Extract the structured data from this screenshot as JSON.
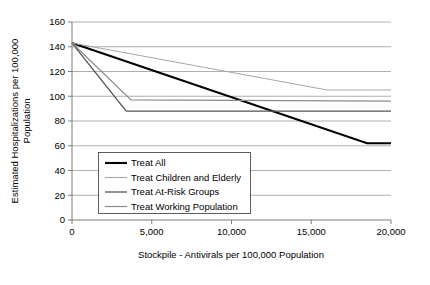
{
  "chart_data": {
    "type": "line",
    "title": "",
    "xlabel": "Stockpile - Antivirals per 100,000 Population",
    "ylabel": "Estimated Hospitalizations per 100,000 Population",
    "xlim": [
      0,
      20000
    ],
    "ylim": [
      0,
      160
    ],
    "xticks": [
      0,
      5000,
      10000,
      15000,
      20000
    ],
    "xtick_labels": [
      "0",
      "5,000",
      "10,000",
      "15,000",
      "20,000"
    ],
    "yticks": [
      0,
      20,
      40,
      60,
      80,
      100,
      120,
      140,
      160
    ],
    "ytick_labels": [
      "0",
      "20",
      "40",
      "60",
      "80",
      "100",
      "120",
      "140",
      "160"
    ],
    "grid": "horizontal",
    "legend_position": "lower-left-inside",
    "series": [
      {
        "name": "Treat All",
        "color": "#000000",
        "width": 2.1,
        "points": [
          [
            0,
            143
          ],
          [
            18500,
            62
          ],
          [
            20000,
            62
          ]
        ]
      },
      {
        "name": "Treat Children and Elderly",
        "color": "#a8a8a8",
        "width": 1.1,
        "points": [
          [
            0,
            143
          ],
          [
            16000,
            105
          ],
          [
            20000,
            105
          ]
        ]
      },
      {
        "name": "Treat At-Risk Groups",
        "color": "#545454",
        "width": 1.3,
        "points": [
          [
            0,
            143
          ],
          [
            3400,
            88
          ],
          [
            20000,
            88
          ]
        ]
      },
      {
        "name": "Treat Working Population",
        "color": "#8a8a8a",
        "width": 1.2,
        "points": [
          [
            0,
            143
          ],
          [
            3700,
            97
          ],
          [
            20000,
            96
          ]
        ]
      }
    ]
  },
  "legend": {
    "items": [
      {
        "label": "Treat All"
      },
      {
        "label": "Treat Children and Elderly"
      },
      {
        "label": "Treat At-Risk Groups"
      },
      {
        "label": "Treat Working Population"
      }
    ]
  },
  "axis_title_lines": {
    "y_line1": "Estimated Hospitalizations per 100,000",
    "y_line2": "Population"
  }
}
